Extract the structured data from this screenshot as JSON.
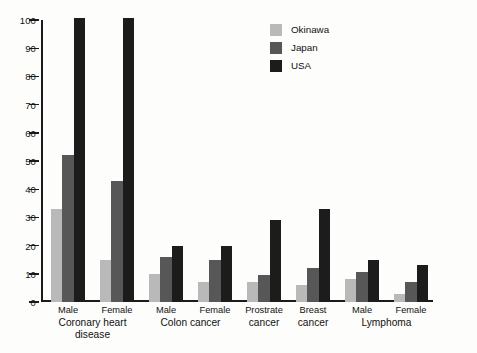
{
  "chart_data": {
    "type": "bar",
    "title": "",
    "xlabel": "",
    "ylabel": "",
    "ylim": [
      0,
      100
    ],
    "yticks": [
      0,
      10,
      20,
      30,
      40,
      50,
      60,
      70,
      80,
      90,
      100
    ],
    "grid": false,
    "legend_position": "top-right",
    "categories": [
      "Male",
      "Female",
      "Male",
      "Female",
      "Prostrate",
      "Breast",
      "Male",
      "Female"
    ],
    "group_labels": [
      "Coronary heart disease",
      "Colon cancer",
      "Prostrate cancer",
      "Breast cancer",
      "Lymphoma"
    ],
    "series": [
      {
        "name": "Okinawa",
        "color": "#b9b9b9",
        "values": [
          33,
          15,
          10,
          7,
          7,
          6,
          8,
          3
        ]
      },
      {
        "name": "Japan",
        "color": "#575757",
        "values": [
          52,
          43,
          16,
          15,
          9.5,
          12,
          10.5,
          7
        ]
      },
      {
        "name": "USA",
        "color": "#1c1c1c",
        "values": [
          101,
          101,
          20,
          20,
          29,
          33,
          15,
          13
        ]
      }
    ]
  },
  "axis": {
    "y_tick_labels": [
      "0",
      "10",
      "20",
      "30",
      "40",
      "50",
      "60",
      "70",
      "80",
      "90",
      "100"
    ]
  },
  "legend": {
    "items": [
      {
        "label": "Okinawa",
        "swatch": "okinawa"
      },
      {
        "label": "Japan",
        "swatch": "japan"
      },
      {
        "label": "USA",
        "swatch": "usa"
      }
    ]
  },
  "xaxis": {
    "tier1": [
      {
        "label": "Male"
      },
      {
        "label": "Female"
      },
      {
        "label": "Male"
      },
      {
        "label": "Female"
      },
      {
        "label": "Prostrate"
      },
      {
        "label": "Breast"
      },
      {
        "label": "Male"
      },
      {
        "label": "Female"
      }
    ],
    "tier2": [
      {
        "line1": "Coronary heart",
        "line2": "disease"
      },
      {
        "line1": "Colon cancer",
        "line2": ""
      },
      {
        "line1": "cancer",
        "line2": ""
      },
      {
        "line1": "cancer",
        "line2": ""
      },
      {
        "line1": "Lymphoma",
        "line2": ""
      }
    ]
  },
  "caption": {
    "text": ""
  },
  "colors": {
    "okinawa": "#b9b9b9",
    "japan": "#575757",
    "usa": "#1c1c1c",
    "axis": "#1b1b1b",
    "text": "#111111"
  }
}
